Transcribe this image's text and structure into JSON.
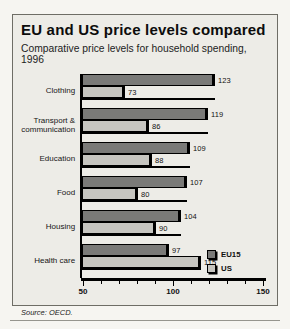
{
  "header": {
    "title": "EU and US price levels compared",
    "subtitle": "Comparative price levels for household spending, 1996"
  },
  "chart_data": {
    "type": "bar",
    "orientation": "horizontal",
    "title": "EU and US price levels compared",
    "subtitle": "Comparative price levels for household spending, 1996",
    "categories": [
      "Clothing",
      "Transport & communication",
      "Education",
      "Food",
      "Housing",
      "Health care"
    ],
    "series": [
      {
        "name": "EU15",
        "color": "#7a7a78",
        "values": [
          123,
          119,
          109,
          107,
          104,
          97
        ]
      },
      {
        "name": "US",
        "color": "#c6c5c0",
        "values": [
          73,
          86,
          88,
          80,
          90,
          115
        ]
      }
    ],
    "xlim": [
      50,
      150
    ],
    "ticks": [
      50,
      100,
      150
    ],
    "minor_tick_step": 10,
    "grid": false,
    "legend_position": "bottom-right"
  },
  "source": "Source: OECD."
}
